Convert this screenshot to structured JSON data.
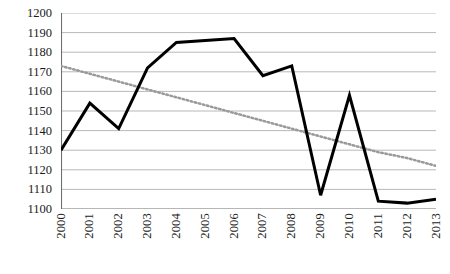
{
  "chart_data": {
    "type": "line",
    "title": "",
    "subtitle": "",
    "xlabel": "",
    "ylabel": "",
    "categories": [
      "2000",
      "2001",
      "2002",
      "2003",
      "2004",
      "2005",
      "2006",
      "2007",
      "2008",
      "2009",
      "2010",
      "2011",
      "2012",
      "2013"
    ],
    "ylim": [
      1100,
      1200
    ],
    "ytick_step": 10,
    "yticks": [
      "1200",
      "1190",
      "1180",
      "1170",
      "1160",
      "1150",
      "1140",
      "1130",
      "1120",
      "1110",
      "1100"
    ],
    "grid": true,
    "grid_axis": "y",
    "legend": "none",
    "legend_position": "none",
    "annotations": [],
    "series": [
      {
        "name": "data",
        "style": "solid",
        "color": "#000000",
        "width": 3,
        "values": [
          1130,
          1154,
          1141,
          1172,
          1185,
          1186,
          1187,
          1168,
          1173,
          1107,
          1158,
          1104,
          1103,
          1105
        ]
      },
      {
        "name": "trendline",
        "style": "dotted",
        "color": "#9a9a9a",
        "width": 2.5,
        "values": [
          1173,
          1169,
          1165,
          1161,
          1157,
          1153,
          1149,
          1145,
          1141,
          1137,
          1133,
          1129,
          1126,
          1122
        ]
      }
    ]
  },
  "axes": {
    "y_axis_color": "#6e6e6e",
    "x_axis_color": "#6e6e6e",
    "grid_color": "#b0b0b0",
    "tick_color": "#6e6e6e"
  }
}
